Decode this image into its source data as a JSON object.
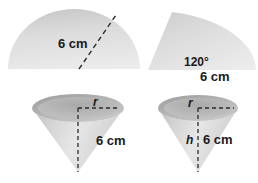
{
  "figure": {
    "background_color": "#ffffff",
    "shape_fill_light": "#e8e8e8",
    "shape_fill_mid": "#d4d4d4",
    "shape_fill_dark": "#b9b9b9",
    "label_color": "#1a1a1a",
    "dash_color": "#2a2a2a",
    "shapes": [
      {
        "id": "semicircle",
        "name": "semicircle",
        "labels": [
          "6 cm"
        ],
        "dimension_label": "6 cm",
        "description": "shaded semicircle with dashed radius"
      },
      {
        "id": "sector",
        "name": "sector",
        "labels": [
          "120°",
          "6 cm"
        ],
        "angle_label": "120°",
        "radius_label": "6 cm",
        "description": "shaded circular sector of 120 degrees"
      },
      {
        "id": "cone-left",
        "name": "cone",
        "labels": [
          "r",
          "6 cm"
        ],
        "radius_label": "r",
        "slant_label": "6 cm",
        "description": "cone with dashed radius and dashed axis"
      },
      {
        "id": "cone-right",
        "name": "cone",
        "labels": [
          "r",
          "h",
          "6 cm"
        ],
        "radius_label": "r",
        "height_label": "h",
        "slant_label": "6 cm",
        "description": "cone with dashed radius, dashed height h and slant 6 cm"
      }
    ],
    "text": {
      "semicircle_radius": "6 cm",
      "sector_angle": "120°",
      "sector_radius": "6 cm",
      "cone1_radius": "r",
      "cone1_slant": "6 cm",
      "cone2_radius": "r",
      "cone2_height": "h",
      "cone2_slant": "6 cm"
    }
  }
}
